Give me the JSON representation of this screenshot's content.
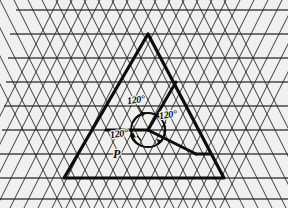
{
  "figure": {
    "background_color": "#f2f0ee",
    "ink_color": "#0d0d0d",
    "lattice_color": "#2b2b2b",
    "labels": {
      "angle_top": "120°",
      "angle_right": "120°",
      "angle_left": "120°",
      "point": "P"
    },
    "geometry": {
      "canvas": {
        "width": 288,
        "height": 208
      },
      "lattice": {
        "type": "triangular",
        "row_spacing": 24,
        "column_spacing": 28,
        "horizontal_rows_y": [
          10,
          34,
          58,
          82,
          106,
          130,
          154,
          178,
          198
        ],
        "directions": [
          "horizontal",
          "up-right-60",
          "up-left-60"
        ]
      },
      "main_triangle": {
        "apex": [
          148,
          34
        ],
        "bottom_left": [
          64,
          178
        ],
        "bottom_right": [
          224,
          178
        ]
      },
      "steiner_point": [
        148,
        130
      ],
      "steiner_branches": [
        {
          "to": [
            176,
            82
          ],
          "description": "branch toward upper-right edge"
        },
        {
          "to": [
            106,
            130
          ],
          "description": "branch toward left edge"
        },
        {
          "to": [
            196,
            154
          ],
          "description": "branch toward lower-right edge"
        }
      ],
      "angle_circle": {
        "center": [
          148,
          130
        ],
        "radius": 17
      }
    }
  }
}
